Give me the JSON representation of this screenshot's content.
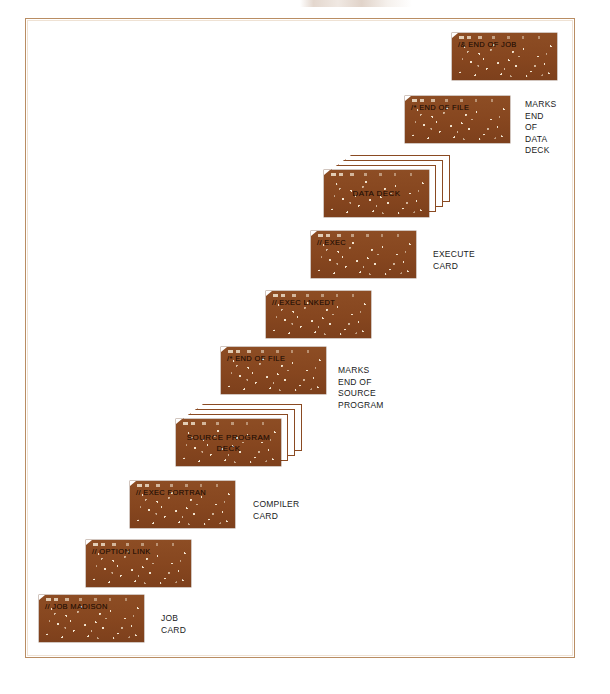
{
  "diagram": {
    "colors": {
      "card_brown": "#8a4a22",
      "frame_border": "#b98d63",
      "punch_hole": "#f2e4cf",
      "page_background": "#ffffff",
      "annotation_text": "#1a1a1a"
    },
    "cards": [
      {
        "id": "end-of-job",
        "punch_text": "/& END OF JOB",
        "caption": "",
        "annotation": "",
        "stacked": false,
        "x": 452,
        "y": 33
      },
      {
        "id": "end-of-file-data",
        "punch_text": "/* END OF FILE",
        "caption": "",
        "annotation": "MARKS\nEND OF\nDATA\nDECK",
        "annotation_x": 120,
        "annotation_y": 3,
        "stacked": false,
        "x": 405,
        "y": 96
      },
      {
        "id": "data-deck",
        "punch_text": "",
        "caption": "DATA DECK",
        "annotation": "",
        "stacked": true,
        "x": 324,
        "y": 170
      },
      {
        "id": "exec",
        "punch_text": "// EXEC",
        "caption": "",
        "annotation": "EXECUTE CARD",
        "annotation_x": 122,
        "annotation_y": 18,
        "stacked": false,
        "x": 311,
        "y": 231
      },
      {
        "id": "exec-lnkedt",
        "punch_text": "// EXEC LNKEDT",
        "caption": "",
        "annotation": "",
        "stacked": false,
        "x": 266,
        "y": 291
      },
      {
        "id": "end-of-file-source",
        "punch_text": "/* END OF FILE",
        "caption": "",
        "annotation": "MARKS END OF SOURCE PROGRAM",
        "annotation_x": 117,
        "annotation_y": 18,
        "stacked": false,
        "x": 221,
        "y": 347
      },
      {
        "id": "source-program-deck",
        "punch_text": "",
        "caption": "SOURCE PROGRAM\nDECK",
        "annotation": "",
        "stacked": true,
        "x": 176,
        "y": 419
      },
      {
        "id": "exec-fortran",
        "punch_text": "// EXEC FORTRAN",
        "caption": "",
        "annotation": "COMPILER CARD",
        "annotation_x": 123,
        "annotation_y": 18,
        "stacked": false,
        "x": 130,
        "y": 481
      },
      {
        "id": "option-link",
        "punch_text": "// OPTION LINK",
        "caption": "",
        "annotation": "",
        "stacked": false,
        "x": 86,
        "y": 540
      },
      {
        "id": "job-madison",
        "punch_text": "// JOB MADISON",
        "caption": "",
        "annotation": "JOB CARD",
        "annotation_x": 122,
        "annotation_y": 18,
        "stacked": false,
        "x": 39,
        "y": 595
      }
    ]
  }
}
